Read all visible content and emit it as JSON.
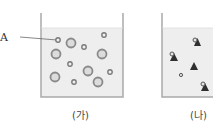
{
  "diagram": {
    "label_A": "A",
    "beakers": [
      {
        "id": "ga",
        "caption": "(가)",
        "contents": "circles of two sizes (small and large particles)"
      },
      {
        "id": "na",
        "caption": "(나)",
        "contents": "triangles with attached small circles, one free small circle"
      }
    ],
    "colors": {
      "liquid": "#eeeeee",
      "wall": "#a9a9a9",
      "particle": "#8a8a8a",
      "triangle": "#2f2f2f"
    }
  }
}
